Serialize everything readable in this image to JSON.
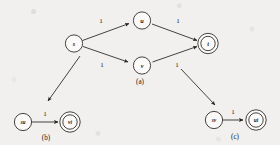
{
  "figure": {
    "caption_a": "(a)",
    "caption_b": "(b)",
    "caption_c": "(c)"
  },
  "graph_a": {
    "nodes": {
      "s": {
        "label": "s",
        "accepting": false
      },
      "u": {
        "label": "u",
        "accepting": false
      },
      "v": {
        "label": "v",
        "accepting": false
      },
      "t": {
        "label": "t",
        "accepting": true
      }
    },
    "edges": {
      "s_u": {
        "label": "1"
      },
      "s_v": {
        "label": "1"
      },
      "u_t": {
        "label": "1"
      },
      "v_t": {
        "label": "1"
      }
    }
  },
  "graph_b": {
    "nodes": {
      "su": {
        "label": "su",
        "accepting": false
      },
      "vt": {
        "label": "vt",
        "accepting": true
      }
    },
    "edges": {
      "su_vt": {
        "label": "1"
      }
    }
  },
  "graph_c": {
    "nodes": {
      "sv": {
        "label": "sv",
        "accepting": false
      },
      "ut": {
        "label": "ut",
        "accepting": true
      }
    },
    "edges": {
      "sv_ut": {
        "label": "1"
      }
    }
  },
  "colors": {
    "ink": "#26231f",
    "paper": "#f2f0ee"
  }
}
